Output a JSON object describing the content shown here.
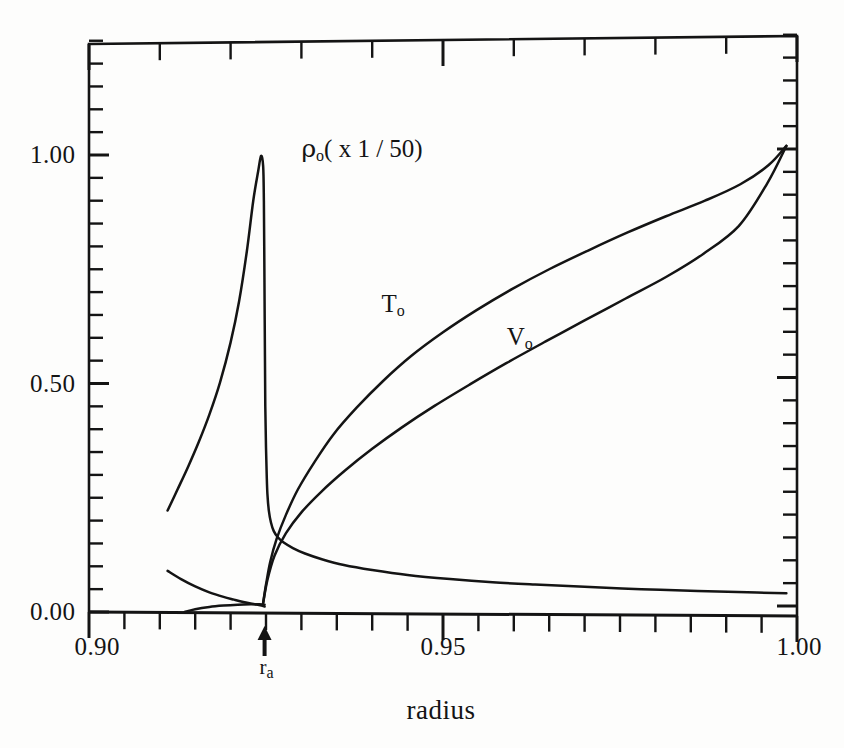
{
  "figure": {
    "kind": "scientific-line-plot",
    "background": "#fdfdfc",
    "ink_color": "#141414"
  },
  "axes": {
    "x_title": "radius",
    "y_title": "",
    "x_tick_labels": [
      "0.90",
      "0.95",
      "1.00"
    ],
    "y_tick_labels": [
      "0.00",
      "0.50",
      "1.00"
    ],
    "x_major_values": [
      0.9,
      0.95,
      1.0
    ],
    "y_major_values": [
      0.0,
      0.5,
      1.0
    ],
    "x_minor_count_per_major": 5,
    "y_minor_count_per_major": 10
  },
  "annotations": {
    "ra_marker": "r",
    "ra_sub": "a",
    "rho_label_main": "ρ",
    "rho_label_sub": "o",
    "rho_label_scale": "( x 1 / 50)",
    "t_label_main": "T",
    "t_label_sub": "o",
    "v_label_main": "V",
    "v_label_sub": "o"
  },
  "chart_data": {
    "type": "line",
    "title": "",
    "xlabel": "radius",
    "ylabel": "",
    "xlim": [
      0.9,
      1.0
    ],
    "ylim": [
      0.0,
      1.25
    ],
    "grid": false,
    "legend": "inline-curve-labels",
    "xticks": [
      0.9,
      0.95,
      1.0
    ],
    "xticklabels": [
      "0.90",
      "0.95",
      "1.00"
    ],
    "yticks": [
      0.0,
      0.5,
      1.0
    ],
    "yticklabels": [
      "0.00",
      "0.50",
      "1.00"
    ],
    "ra_value": 0.9248,
    "series": [
      {
        "name": "rho_o (x 1/50)",
        "label": "ρo( x 1 / 50)",
        "label_x": 0.93,
        "label_y": 1.01,
        "x": [
          0.9111,
          0.9125,
          0.914,
          0.9155,
          0.917,
          0.9185,
          0.92,
          0.9212,
          0.9223,
          0.9232,
          0.9239,
          0.9243,
          0.9246,
          0.9247,
          0.92475,
          0.9248,
          0.92485,
          0.9249,
          0.925,
          0.9251,
          0.9252,
          0.9254,
          0.9257,
          0.9261,
          0.9267,
          0.9275,
          0.9288,
          0.9305,
          0.933,
          0.936,
          0.94,
          0.945,
          0.951,
          0.957,
          0.963,
          0.97,
          0.978,
          0.986,
          0.993,
          0.9985
        ],
        "y": [
          0.222,
          0.268,
          0.318,
          0.372,
          0.432,
          0.502,
          0.59,
          0.68,
          0.79,
          0.9,
          0.965,
          0.998,
          0.975,
          0.9,
          0.8,
          0.68,
          0.56,
          0.45,
          0.36,
          0.3,
          0.258,
          0.222,
          0.196,
          0.177,
          0.163,
          0.152,
          0.14,
          0.128,
          0.115,
          0.103,
          0.092,
          0.081,
          0.072,
          0.065,
          0.06,
          0.055,
          0.05,
          0.046,
          0.043,
          0.041
        ]
      },
      {
        "name": "rho_o lower branch",
        "label": "",
        "x": [
          0.9111,
          0.913,
          0.915,
          0.917,
          0.919,
          0.9205,
          0.9218,
          0.923,
          0.924,
          0.9246,
          0.9248
        ],
        "y": [
          0.09,
          0.072,
          0.056,
          0.043,
          0.033,
          0.027,
          0.022,
          0.018,
          0.015,
          0.013,
          0.012
        ]
      },
      {
        "name": "near-zero trace",
        "label": "",
        "x": [
          0.9135,
          0.915,
          0.917,
          0.919,
          0.921,
          0.9228,
          0.924,
          0.9248
        ],
        "y": [
          0.0,
          0.006,
          0.011,
          0.014,
          0.016,
          0.017,
          0.017,
          0.016
        ]
      },
      {
        "name": "T_o",
        "label": "To",
        "label_x": 0.9413,
        "label_y": 0.672,
        "x": [
          0.9246,
          0.925,
          0.9256,
          0.9265,
          0.9278,
          0.9295,
          0.9318,
          0.9345,
          0.9378,
          0.9415,
          0.9455,
          0.95,
          0.9548,
          0.9598,
          0.965,
          0.9705,
          0.976,
          0.9815,
          0.987,
          0.992,
          0.996,
          0.9985
        ],
        "y": [
          0.02,
          0.06,
          0.11,
          0.16,
          0.212,
          0.268,
          0.327,
          0.388,
          0.447,
          0.505,
          0.56,
          0.612,
          0.661,
          0.707,
          0.75,
          0.791,
          0.83,
          0.866,
          0.9,
          0.936,
          0.978,
          1.02
        ]
      },
      {
        "name": "V_o",
        "label": "Vo",
        "label_x": 0.959,
        "label_y": 0.6,
        "x": [
          0.9246,
          0.9252,
          0.9262,
          0.9278,
          0.93,
          0.9328,
          0.9362,
          0.94,
          0.9442,
          0.9488,
          0.9538,
          0.959,
          0.9645,
          0.97,
          0.9758,
          0.9815,
          0.9868,
          0.9918,
          0.9958,
          0.9985
        ],
        "y": [
          0.02,
          0.07,
          0.123,
          0.172,
          0.218,
          0.263,
          0.31,
          0.357,
          0.404,
          0.451,
          0.498,
          0.545,
          0.592,
          0.638,
          0.686,
          0.733,
          0.784,
          0.845,
          0.938,
          1.02
        ]
      }
    ]
  }
}
